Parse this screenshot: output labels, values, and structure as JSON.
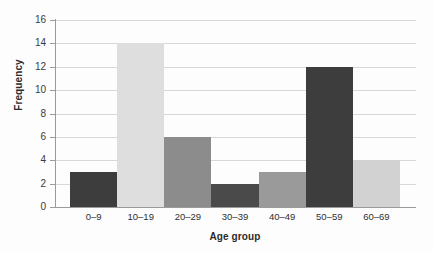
{
  "chart_data": {
    "type": "bar",
    "title": "",
    "xlabel": "Age group",
    "ylabel": "Frequency",
    "categories": [
      "0–9",
      "10–19",
      "20–29",
      "30–39",
      "40–49",
      "50–59",
      "60–69"
    ],
    "values": [
      3,
      14,
      6,
      2,
      3,
      12,
      4
    ],
    "bar_colors": [
      "#3d3d3d",
      "#dedede",
      "#8c8c8c",
      "#4a4a4a",
      "#9a9a9a",
      "#3d3d3d",
      "#d2d2d2"
    ],
    "ylim": [
      0,
      16
    ],
    "ytick_labels": [
      "0",
      "2",
      "4",
      "6",
      "8",
      "10",
      "12",
      "14",
      "16"
    ],
    "ytick_values": [
      0,
      2,
      4,
      6,
      8,
      10,
      12,
      14,
      16
    ],
    "grid": true,
    "grid_color": "#d8d8d8",
    "axis_color": "#9a9a9a",
    "legend": "none",
    "background": "#fdfdfd"
  }
}
